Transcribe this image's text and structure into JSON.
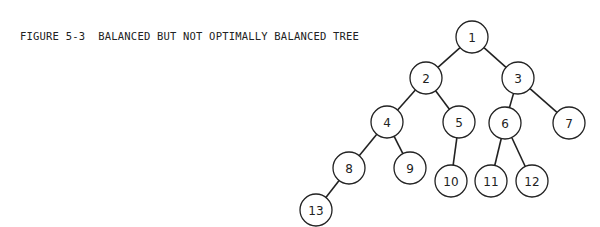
{
  "figure": {
    "caption": "FIGURE 5-3  BALANCED BUT NOT OPTIMALLY BALANCED TREE"
  },
  "tree": {
    "radius": 16,
    "nodes": [
      {
        "id": "1",
        "label": "1",
        "x": 472,
        "y": 37
      },
      {
        "id": "2",
        "label": "2",
        "x": 426,
        "y": 78
      },
      {
        "id": "3",
        "label": "3",
        "x": 518,
        "y": 78
      },
      {
        "id": "4",
        "label": "4",
        "x": 387,
        "y": 122
      },
      {
        "id": "5",
        "label": "5",
        "x": 459,
        "y": 122
      },
      {
        "id": "6",
        "label": "6",
        "x": 505,
        "y": 123
      },
      {
        "id": "7",
        "label": "7",
        "x": 569,
        "y": 123
      },
      {
        "id": "8",
        "label": "8",
        "x": 349,
        "y": 168
      },
      {
        "id": "9",
        "label": "9",
        "x": 410,
        "y": 168
      },
      {
        "id": "10",
        "label": "10",
        "x": 451,
        "y": 181
      },
      {
        "id": "11",
        "label": "11",
        "x": 491,
        "y": 181
      },
      {
        "id": "12",
        "label": "12",
        "x": 532,
        "y": 181
      },
      {
        "id": "13",
        "label": "13",
        "x": 316,
        "y": 210
      }
    ],
    "edges": [
      [
        "1",
        "2"
      ],
      [
        "1",
        "3"
      ],
      [
        "2",
        "4"
      ],
      [
        "2",
        "5"
      ],
      [
        "3",
        "6"
      ],
      [
        "3",
        "7"
      ],
      [
        "4",
        "8"
      ],
      [
        "4",
        "9"
      ],
      [
        "5",
        "10"
      ],
      [
        "6",
        "11"
      ],
      [
        "6",
        "12"
      ],
      [
        "8",
        "13"
      ]
    ]
  }
}
